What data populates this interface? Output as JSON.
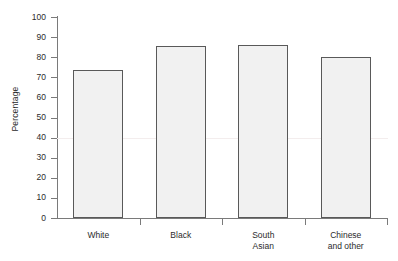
{
  "chart_data": {
    "type": "bar",
    "title": "",
    "xlabel": "",
    "ylabel": "Percentage",
    "categories": [
      "White",
      "Black",
      "South\nAsian",
      "Chinese\nand other"
    ],
    "values": [
      73.5,
      85.5,
      86,
      80
    ],
    "ylim": [
      0,
      100
    ],
    "yticks": [
      0,
      10,
      20,
      30,
      40,
      50,
      60,
      70,
      80,
      90,
      100
    ],
    "ytick_labels": [
      "0",
      "10",
      "20",
      "30",
      "40",
      "50",
      "60",
      "70",
      "80",
      "90",
      "100"
    ],
    "grid": false,
    "legend": null,
    "colors": {
      "bar_fill": "#f1f1f1",
      "bar_border": "#595959",
      "axis": "#7a7a7a",
      "text": "#2b2b2b",
      "background": "#ffffff"
    }
  },
  "axis": {
    "y_label": "Percentage"
  }
}
